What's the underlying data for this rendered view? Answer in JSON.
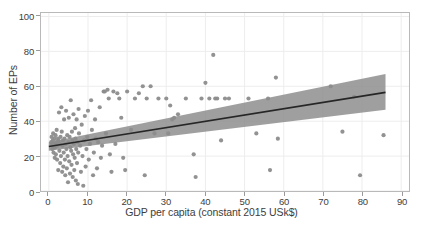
{
  "chart_data": {
    "type": "scatter",
    "title": "",
    "xlabel": "GDP per capita (constant 2015 USk$)",
    "ylabel": "Number of EPs",
    "xlim": [
      -2,
      92
    ],
    "ylim": [
      0,
      102
    ],
    "xticks": [
      0,
      10,
      20,
      30,
      40,
      50,
      60,
      70,
      80,
      90
    ],
    "yticks": [
      0,
      20,
      40,
      60,
      80,
      100
    ],
    "grid": true,
    "legend": "none",
    "marker_color": "#8c8c8c",
    "line_color": "#262626",
    "band_color": "#8a8a8a",
    "points": [
      [
        0.6,
        28
      ],
      [
        0.7,
        31
      ],
      [
        0.8,
        26
      ],
      [
        0.9,
        24
      ],
      [
        1.0,
        29
      ],
      [
        1.1,
        33
      ],
      [
        1.2,
        22
      ],
      [
        1.3,
        27
      ],
      [
        1.4,
        30
      ],
      [
        1.5,
        19
      ],
      [
        1.6,
        25
      ],
      [
        1.7,
        32
      ],
      [
        1.8,
        21
      ],
      [
        1.9,
        28
      ],
      [
        2.0,
        35
      ],
      [
        2.1,
        18
      ],
      [
        2.2,
        26
      ],
      [
        2.3,
        30
      ],
      [
        2.4,
        12
      ],
      [
        2.5,
        29
      ],
      [
        2.6,
        45
      ],
      [
        2.7,
        23
      ],
      [
        2.8,
        27
      ],
      [
        2.9,
        16
      ],
      [
        3.0,
        31
      ],
      [
        3.1,
        20
      ],
      [
        3.2,
        48
      ],
      [
        3.3,
        34
      ],
      [
        3.4,
        11
      ],
      [
        3.5,
        26
      ],
      [
        3.6,
        29
      ],
      [
        3.7,
        14
      ],
      [
        3.8,
        22
      ],
      [
        3.9,
        41
      ],
      [
        4.0,
        30
      ],
      [
        4.1,
        18
      ],
      [
        4.2,
        9
      ],
      [
        4.3,
        27
      ],
      [
        4.4,
        46
      ],
      [
        4.5,
        24
      ],
      [
        4.6,
        13
      ],
      [
        4.7,
        32
      ],
      [
        4.8,
        20
      ],
      [
        4.9,
        5
      ],
      [
        5.0,
        28
      ],
      [
        5.1,
        42
      ],
      [
        5.2,
        17
      ],
      [
        5.3,
        31
      ],
      [
        5.4,
        10
      ],
      [
        5.5,
        25
      ],
      [
        5.6,
        52
      ],
      [
        5.7,
        23
      ],
      [
        5.8,
        15
      ],
      [
        5.9,
        34
      ],
      [
        6.0,
        29
      ],
      [
        6.1,
        8
      ],
      [
        6.2,
        21
      ],
      [
        6.3,
        44
      ],
      [
        6.4,
        27
      ],
      [
        6.5,
        12
      ],
      [
        6.6,
        19
      ],
      [
        6.7,
        36
      ],
      [
        6.8,
        30
      ],
      [
        6.9,
        6
      ],
      [
        7.0,
        24
      ],
      [
        7.1,
        41
      ],
      [
        7.2,
        16
      ],
      [
        7.3,
        28
      ],
      [
        7.4,
        4
      ],
      [
        7.5,
        22
      ],
      [
        7.6,
        47
      ],
      [
        7.7,
        33
      ],
      [
        8.0,
        26
      ],
      [
        8.2,
        11
      ],
      [
        8.4,
        38
      ],
      [
        8.6,
        20
      ],
      [
        8.8,
        3
      ],
      [
        9.0,
        29
      ],
      [
        9.2,
        43
      ],
      [
        9.4,
        14
      ],
      [
        9.6,
        24
      ],
      [
        9.8,
        31
      ],
      [
        10.0,
        46
      ],
      [
        10.2,
        18
      ],
      [
        10.5,
        27
      ],
      [
        10.8,
        52
      ],
      [
        11.0,
        35
      ],
      [
        11.3,
        9
      ],
      [
        11.5,
        22
      ],
      [
        11.8,
        41
      ],
      [
        12.0,
        30
      ],
      [
        12.3,
        13
      ],
      [
        12.6,
        28
      ],
      [
        13.0,
        48
      ],
      [
        13.3,
        19
      ],
      [
        13.6,
        26
      ],
      [
        14.0,
        57
      ],
      [
        14.3,
        57
      ],
      [
        14.6,
        33
      ],
      [
        15.0,
        58
      ],
      [
        15.3,
        53
      ],
      [
        15.6,
        21
      ],
      [
        16.0,
        11
      ],
      [
        16.5,
        57
      ],
      [
        17.0,
        27
      ],
      [
        17.5,
        56
      ],
      [
        18.0,
        53
      ],
      [
        18.5,
        42
      ],
      [
        19.0,
        19
      ],
      [
        19.5,
        12
      ],
      [
        20.0,
        57
      ],
      [
        21.0,
        35
      ],
      [
        22.0,
        53
      ],
      [
        23.0,
        56
      ],
      [
        24.0,
        60
      ],
      [
        24.5,
        9
      ],
      [
        25.0,
        53
      ],
      [
        26.0,
        60
      ],
      [
        27.0,
        33
      ],
      [
        28.0,
        53
      ],
      [
        30.0,
        53
      ],
      [
        30.5,
        33
      ],
      [
        31.0,
        49
      ],
      [
        31.5,
        41
      ],
      [
        32.0,
        42
      ],
      [
        33.0,
        44
      ],
      [
        35.0,
        53
      ],
      [
        37.0,
        21
      ],
      [
        37.5,
        8
      ],
      [
        39.0,
        53
      ],
      [
        40.0,
        62
      ],
      [
        41.0,
        53
      ],
      [
        42.0,
        78
      ],
      [
        42.5,
        53
      ],
      [
        43.0,
        53
      ],
      [
        44.0,
        29
      ],
      [
        45.0,
        53
      ],
      [
        46.0,
        53
      ],
      [
        51.0,
        53
      ],
      [
        53.0,
        33
      ],
      [
        56.0,
        53
      ],
      [
        56.5,
        12
      ],
      [
        58.0,
        65
      ],
      [
        58.5,
        30
      ],
      [
        72.0,
        60
      ],
      [
        75.0,
        34
      ],
      [
        78.0,
        54
      ],
      [
        79.5,
        9
      ],
      [
        85.5,
        32
      ]
    ],
    "fit_line": {
      "x_start": 0,
      "x_end": 86,
      "y_start": 25.5,
      "y_end": 56.5
    },
    "confidence_band": {
      "x_start": 0,
      "x_end": 86,
      "upper_start": 28.0,
      "upper_end": 67.0,
      "lower_start": 23.0,
      "lower_end": 46.5
    }
  }
}
